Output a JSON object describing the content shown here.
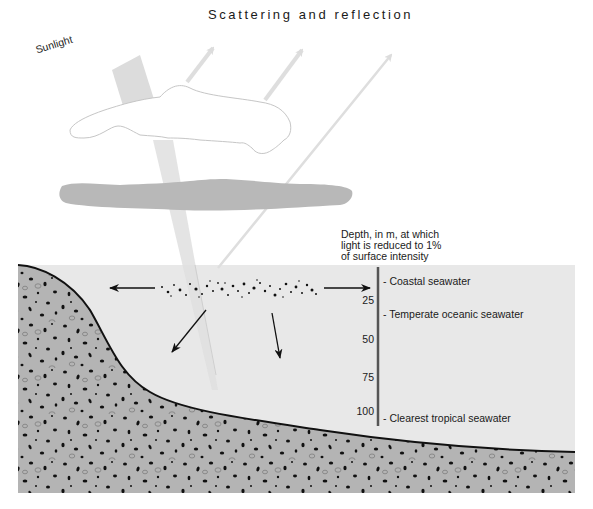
{
  "diagram": {
    "title": "Scattering and reflection",
    "sunlight_label": "Sunlight",
    "depth_header": [
      "Depth, in m, at which",
      "light is reduced to 1%",
      "of surface intensity"
    ],
    "depth_scale": {
      "ticks": [
        {
          "label": "25",
          "y": 300
        },
        {
          "label": "50",
          "y": 339
        },
        {
          "label": "75",
          "y": 377
        },
        {
          "label": "100",
          "y": 411
        }
      ]
    },
    "water_types": [
      {
        "label": "- Coastal seawater",
        "y": 281
      },
      {
        "label": "- Temperate oceanic seawater",
        "y": 314
      },
      {
        "label": "- Clearest tropical seawater",
        "y": 418
      }
    ],
    "colors": {
      "water": "#e8e8e8",
      "sediment": "#b4b4b4",
      "cloud_dark": "#b8b8b8",
      "beam": "#dcdcdc",
      "reflection_arrows": "#dedede",
      "text": "#1a1a1a"
    },
    "elements": [
      "sunlight-beam",
      "cloud",
      "haze-layer",
      "reflection-arrows",
      "suspended-particles",
      "scatter-arrows",
      "depth-scale",
      "seafloor-sediment"
    ]
  }
}
